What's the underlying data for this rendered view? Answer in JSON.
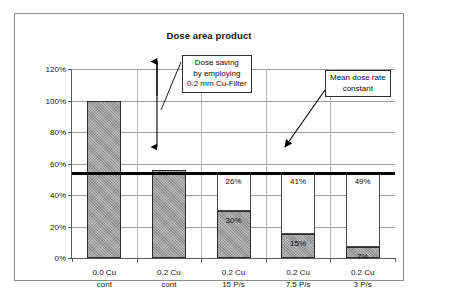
{
  "chart_data": {
    "type": "bar",
    "title": "Dose area product",
    "xlabel": "",
    "ylabel": "",
    "ylim": [
      0,
      120
    ],
    "grid": true,
    "legend": "none",
    "categories": [
      {
        "line1": "0.0 Cu",
        "line2": "cont"
      },
      {
        "line1": "0.2 Cu",
        "line2": "cont"
      },
      {
        "line1": "0.2 Cu",
        "line2": "15 P/s"
      },
      {
        "line1": "0.2 Cu",
        "line2": "7.5 P/s"
      },
      {
        "line1": "0.2 Cu",
        "line2": "3 P/s"
      }
    ],
    "series": [
      {
        "name": "Dose area product",
        "values": [
          100,
          26,
          30,
          15,
          7
        ],
        "labels": [
          "",
          "56%",
          "30%",
          "15%",
          "7%"
        ]
      },
      {
        "name": "Dose saving to mean dose rate line",
        "values": [
          0,
          0,
          26,
          41,
          49
        ],
        "labels": [
          "",
          "56%",
          "26%",
          "41%",
          "49%"
        ]
      }
    ],
    "bars": [
      {
        "category": "0.0 Cu cont",
        "value": 100,
        "value_label": "",
        "remainder_label": "",
        "has_remainder": false
      },
      {
        "category": "0.2 Cu cont",
        "value": 56,
        "value_label": "",
        "remainder_label": "56%",
        "has_remainder": true
      },
      {
        "category": "0.2 Cu 15 P/s",
        "value": 30,
        "value_label": "30%",
        "remainder_label": "26%",
        "has_remainder": true
      },
      {
        "category": "0.2 Cu 7.5 P/s",
        "value": 15,
        "value_label": "15%",
        "remainder_label": "41%",
        "has_remainder": true
      },
      {
        "category": "0.2 Cu 3 P/s",
        "value": 7,
        "value_label": "7%",
        "remainder_label": "49%",
        "has_remainder": true
      }
    ],
    "y_ticks": [
      "0%",
      "20%",
      "40%",
      "60%",
      "80%",
      "100%",
      "120%"
    ],
    "y_tick_values": [
      0,
      20,
      40,
      60,
      80,
      100,
      120
    ],
    "reference_line": {
      "label": "Mean dose rate constant",
      "value": 54
    },
    "annotations": [
      {
        "name": "dose-saving-callout",
        "lines": [
          "Dose saving",
          "by employing",
          "0.2 mm Cu-Filter"
        ],
        "arrow": "double-headed vertical from 100% to 54%"
      },
      {
        "name": "mean-dose-rate-callout",
        "lines": [
          "Mean dose rate",
          "constant"
        ],
        "arrow": "diagonal pointing to reference line"
      }
    ],
    "colors": {
      "bar_fill": "#9b9b9b",
      "bar_outline": "#2c2c2c",
      "reference_line": "#000000",
      "gridline": "#9c9c9c",
      "axis": "#5a5a5a",
      "frame": "#8f8f8f",
      "text": "#141414",
      "background": "#ffffff"
    }
  },
  "edge_fragment": {
    "line1": "",
    "line2": ""
  }
}
